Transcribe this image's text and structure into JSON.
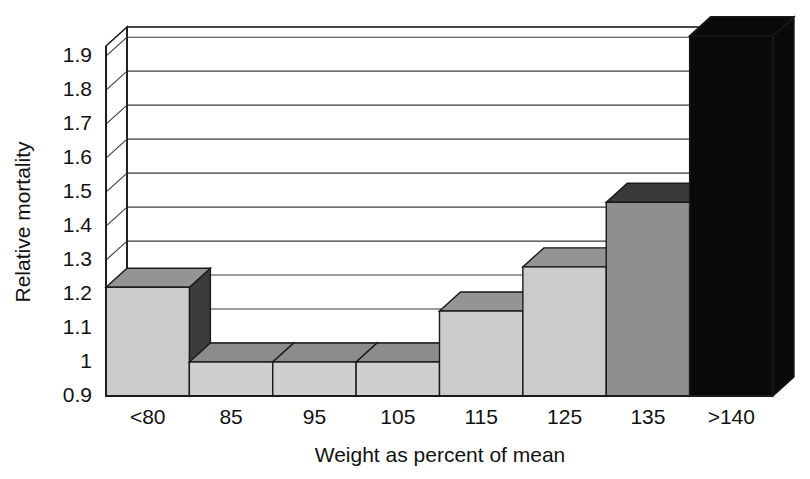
{
  "chart_data": {
    "type": "bar",
    "title": "",
    "subtitle": "",
    "xlabel": "Weight as percent of mean",
    "ylabel": "Relative mortality",
    "categories": [
      "<80",
      "85",
      "95",
      "105",
      "115",
      "125",
      "135",
      ">140"
    ],
    "values": [
      1.22,
      1.0,
      1.0,
      1.0,
      1.15,
      1.28,
      1.47,
      1.96
    ],
    "series": [
      {
        "name": "Relative mortality",
        "values": [
          1.22,
          1.0,
          1.0,
          1.0,
          1.15,
          1.28,
          1.47,
          1.96
        ]
      }
    ],
    "ylim": [
      0.9,
      1.9
    ],
    "y_ticks": [
      "1.9",
      "1.8",
      "1.7",
      "1.6",
      "1.5",
      "1.4",
      "1.3",
      "1.2",
      "1.1",
      "1",
      "0.9"
    ],
    "y_tick_values": [
      1.9,
      1.8,
      1.7,
      1.6,
      1.5,
      1.4,
      1.3,
      1.2,
      1.1,
      1.0,
      0.9
    ],
    "x_ticks": [
      "<80",
      "85",
      "95",
      "105",
      "115",
      "125",
      "135",
      ">140"
    ],
    "grid": true,
    "legend": false,
    "legend_position": "none",
    "style_3d": true,
    "bar_colors": [
      "#cbcbcb",
      "#cfcfcf",
      "#cfcfcf",
      "#cfcfcf",
      "#cbcbcb",
      "#cbcbcb",
      "#8f8f8f",
      "#0a0a0a"
    ],
    "bar_top_colors": [
      "#949494",
      "#8c8c8c",
      "#8c8c8c",
      "#8c8c8c",
      "#949494",
      "#949494",
      "#3a3a3a",
      "#0a0a0a"
    ],
    "bar_side_colors": [
      "#3c3c3c",
      "#8c8c8c",
      "#8c8c8c",
      "#8c8c8c",
      "#8f8f8f",
      "#8f8f8f",
      "#2c2c2c",
      "#0a0a0a"
    ],
    "note_last_bar": "Bar for >140 is black and extends to/above the top of the plot area.",
    "colors": {
      "axis": "#1a1a1a",
      "grid": "#3a3a3a",
      "text": "#111111",
      "background": "#ffffff",
      "bar_light": "#cfcfcf",
      "bar_medium": "#8f8f8f",
      "bar_dark": "#3a3a3a",
      "bar_black": "#0a0a0a"
    }
  },
  "labels": {
    "y_axis_title": "Relative mortality",
    "x_axis_title": "Weight as percent of mean"
  }
}
